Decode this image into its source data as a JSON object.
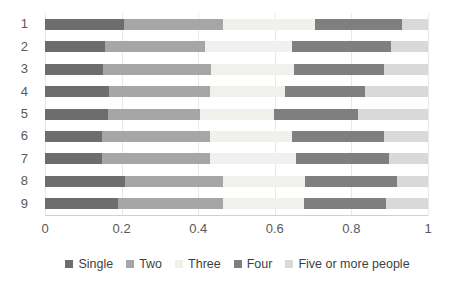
{
  "chart_data": {
    "type": "bar",
    "subtype": "stacked-horizontal-100-percent",
    "title": "",
    "xlabel": "",
    "ylabel": "",
    "xlim": [
      0,
      1
    ],
    "xticks": [
      0,
      0.2,
      0.4,
      0.6,
      0.8,
      1
    ],
    "xtick_labels": [
      "0",
      "0.2",
      "0.4",
      "0.6",
      "0.8",
      "1"
    ],
    "grid": true,
    "grid_axis": "x",
    "legend_position": "bottom",
    "categories": [
      "1",
      "2",
      "3",
      "4",
      "5",
      "6",
      "7",
      "8",
      "9"
    ],
    "series": [
      {
        "name": "Single",
        "color": "#6d6d6d",
        "values": [
          0.205,
          0.156,
          0.151,
          0.167,
          0.165,
          0.15,
          0.149,
          0.208,
          0.19
        ]
      },
      {
        "name": "Two",
        "color": "#a6a6a6",
        "values": [
          0.26,
          0.261,
          0.283,
          0.264,
          0.24,
          0.281,
          0.282,
          0.256,
          0.275
        ]
      },
      {
        "name": "Three",
        "color": "#f0f0ec",
        "values": [
          0.24,
          0.227,
          0.216,
          0.196,
          0.194,
          0.214,
          0.224,
          0.215,
          0.21
        ]
      },
      {
        "name": "Four",
        "color": "#7f7f7f",
        "values": [
          0.228,
          0.259,
          0.235,
          0.208,
          0.219,
          0.24,
          0.242,
          0.241,
          0.215
        ]
      },
      {
        "name": "Five or more people",
        "color": "#d9d9d9",
        "values": [
          0.067,
          0.097,
          0.115,
          0.165,
          0.182,
          0.115,
          0.103,
          0.08,
          0.11
        ]
      }
    ]
  },
  "legend": {
    "items": [
      {
        "label": "Single",
        "color": "#6d6d6d"
      },
      {
        "label": "Two",
        "color": "#a6a6a6"
      },
      {
        "label": "Three",
        "color": "#f0f0ec"
      },
      {
        "label": "Four",
        "color": "#7f7f7f"
      },
      {
        "label": "Five or more people",
        "color": "#d9d9d9"
      }
    ]
  },
  "axes": {
    "x_tick_labels": [
      "0",
      "0.2",
      "0.4",
      "0.6",
      "0.8",
      "1"
    ],
    "y_tick_labels": [
      "1",
      "2",
      "3",
      "4",
      "5",
      "6",
      "7",
      "8",
      "9"
    ]
  }
}
